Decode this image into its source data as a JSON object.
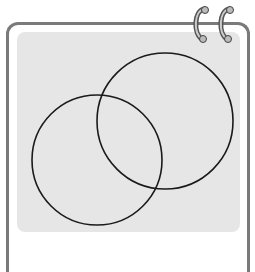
{
  "diagram": {
    "type": "venn",
    "sets": [
      {
        "name": "circle-left",
        "cx": 97,
        "cy": 160,
        "r": 65
      },
      {
        "name": "circle-right",
        "cx": 165,
        "cy": 121,
        "r": 68
      }
    ],
    "stroke_color": "#1a1a1a",
    "panel_color": "#e6e6e6",
    "border_color": "#7a7a7a"
  },
  "caption": {
    "text": ""
  }
}
